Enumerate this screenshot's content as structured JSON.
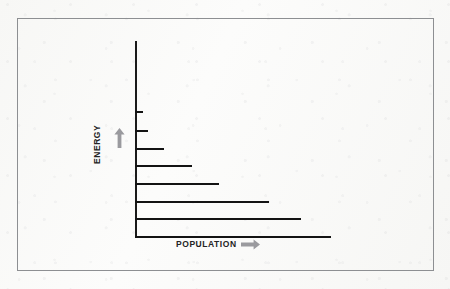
{
  "figure": {
    "background_color": "#fbfaf8",
    "frame_color": "#8d8f92",
    "bar_color": "#131313",
    "arrow_color": "#9a9a9e",
    "axis_color": "#1a1a1a"
  },
  "axes": {
    "y": {
      "label": "ENERGY",
      "arrow_icon": "up-arrow-icon",
      "direction": "up"
    },
    "x": {
      "label": "POPULATION",
      "arrow_icon": "right-arrow-icon",
      "direction": "right"
    }
  },
  "chart_data": {
    "type": "bar",
    "orientation": "horizontal",
    "title": "",
    "xlabel": "POPULATION",
    "ylabel": "ENERGY",
    "grid": false,
    "legend": false,
    "categories": [
      "level-8",
      "level-7",
      "level-6",
      "level-5",
      "level-4",
      "level-3",
      "level-2",
      "level-1"
    ],
    "values": [
      8,
      13,
      29,
      57,
      84,
      134,
      166,
      196
    ],
    "units": "relative population (px-derived)",
    "xlim": [
      0,
      200
    ],
    "ylim": [
      0,
      8
    ],
    "note": "Inverted energy pyramid: population increases as energy level decreases; lowest bar doubles as the horizontal axis.",
    "bars": [
      {
        "name": "level-8",
        "y": 111,
        "length": 8,
        "energy_rank": 8
      },
      {
        "name": "level-7",
        "y": 130,
        "length": 13,
        "energy_rank": 7
      },
      {
        "name": "level-6",
        "y": 148,
        "length": 29,
        "energy_rank": 6
      },
      {
        "name": "level-5",
        "y": 165,
        "length": 57,
        "energy_rank": 5
      },
      {
        "name": "level-4",
        "y": 183,
        "length": 84,
        "energy_rank": 4
      },
      {
        "name": "level-3",
        "y": 201,
        "length": 134,
        "energy_rank": 3
      },
      {
        "name": "level-2",
        "y": 218,
        "length": 166,
        "energy_rank": 2
      },
      {
        "name": "level-1",
        "y": 236,
        "length": 196,
        "energy_rank": 1
      }
    ]
  }
}
